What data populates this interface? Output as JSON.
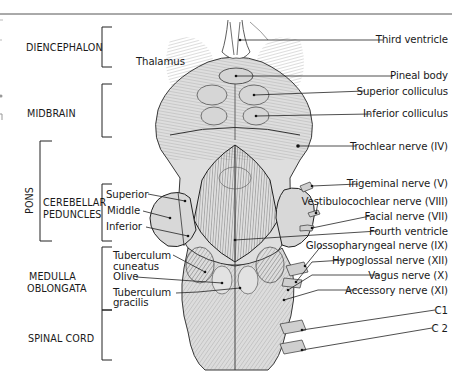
{
  "figure": {
    "regions": [
      {
        "id": "diencephalon",
        "label": "DIENCEPHALON"
      },
      {
        "id": "midbrain",
        "label": "MIDBRAIN"
      },
      {
        "id": "pons",
        "label": "PONS"
      },
      {
        "id": "cerebellar_peduncles",
        "label": "CEREBELLAR\nPEDUNCLES",
        "line1": "CEREBELLAR",
        "line2": "PEDUNCLES"
      },
      {
        "id": "medulla",
        "label": "MEDULLA OBLONGATA",
        "line1": "MEDULLA",
        "line2": "OBLONGATA"
      },
      {
        "id": "spinal_cord",
        "label": "SPINAL CORD"
      }
    ],
    "left_labels": {
      "thalamus": "Thalamus",
      "superior": "Superior",
      "middle": "Middle",
      "inferior": "Inferior",
      "tuberculum_cuneatus_1": "Tuberculum",
      "tuberculum_cuneatus_2": "cuneatus",
      "olive": "Olive",
      "tuberculum_gracilis_1": "Tuberculum",
      "tuberculum_gracilis_2": "gracilis"
    },
    "right_labels": [
      {
        "id": "third_ventricle",
        "label": "Third ventricle"
      },
      {
        "id": "pineal_body",
        "label": "Pineal body"
      },
      {
        "id": "superior_colliculus",
        "label": "Superior colliculus"
      },
      {
        "id": "inferior_colliculus",
        "label": "Inferior colliculus"
      },
      {
        "id": "trochlear_nerve",
        "label": "Trochlear nerve (IV)"
      },
      {
        "id": "trigeminal_nerve",
        "label": "Trigeminal nerve (V)"
      },
      {
        "id": "vestibulocochlear_nerve",
        "label": "Vestibulocochlear nerve (VIII)"
      },
      {
        "id": "facial_nerve",
        "label": "Facial nerve (VII)"
      },
      {
        "id": "fourth_ventricle",
        "label": "Fourth ventricle"
      },
      {
        "id": "glossopharyngeal_nerve",
        "label": "Glossopharyngeal nerve (IX)"
      },
      {
        "id": "hypoglossal_nerve",
        "label": "Hypoglossal nerve (XII)"
      },
      {
        "id": "vagus_nerve",
        "label": "Vagus nerve (X)"
      },
      {
        "id": "accessory_nerve",
        "label": "Accessory nerve (XI)"
      },
      {
        "id": "c1",
        "label": "C1"
      },
      {
        "id": "c2",
        "label": "C 2"
      }
    ],
    "colors": {
      "ink": "#1a1a1a",
      "tissue_fill": "#dcdcdc",
      "tissue_shade": "#c6c6c6",
      "background": "#ffffff",
      "rule": "#555555"
    }
  }
}
